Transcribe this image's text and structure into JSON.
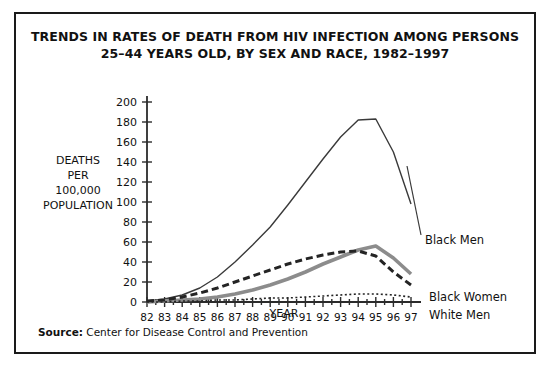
{
  "title": {
    "line1": "TRENDS IN RATES OF DEATH FROM HIV INFECTION AMONG PERSONS",
    "line2": "25–44 YEARS OLD, BY SEX AND RACE, 1982–1997"
  },
  "source": {
    "label": "Source:",
    "text": "Center for Disease Control and Prevention"
  },
  "axis_title": {
    "y_line1": "DEATHS",
    "y_line2": "PER",
    "y_line3": "100,000",
    "y_line4": "POPULATION",
    "x": "YEAR"
  },
  "chart_data": {
    "type": "line",
    "title": "TRENDS IN RATES OF DEATH FROM HIV INFECTION AMONG PERSONS 25–44 YEARS OLD, BY SEX AND RACE, 1982–1997",
    "xlabel": "YEAR",
    "ylabel": "DEATHS PER 100,000 POPULATION",
    "xlim": [
      82,
      97
    ],
    "ylim": [
      0,
      200
    ],
    "ytick_step": 20,
    "grid": false,
    "legend_position": "right-inline-labels",
    "categories": [
      "82",
      "83",
      "84",
      "85",
      "86",
      "87",
      "88",
      "89",
      "90",
      "91",
      "92",
      "93",
      "94",
      "95",
      "96",
      "97"
    ],
    "ytick_labels": [
      "0",
      "20",
      "40",
      "60",
      "80",
      "100",
      "120",
      "140",
      "160",
      "180",
      "200"
    ],
    "series": [
      {
        "name": "Black Men",
        "style": "thin-solid",
        "color": "#3a3a3a",
        "values": [
          1,
          3,
          7,
          14,
          25,
          40,
          57,
          75,
          97,
          120,
          143,
          165,
          182,
          183,
          150,
          98
        ]
      },
      {
        "name": "Black Women",
        "style": "thick-solid",
        "color": "#8c8c8c",
        "values": [
          0,
          1,
          2,
          3,
          5,
          8,
          12,
          17,
          23,
          30,
          38,
          45,
          52,
          56,
          44,
          28
        ]
      },
      {
        "name": "White Men",
        "style": "dashed",
        "color": "#242424",
        "values": [
          1,
          2,
          5,
          9,
          14,
          20,
          26,
          32,
          38,
          43,
          47,
          50,
          51,
          46,
          30,
          17
        ]
      },
      {
        "name": "White Women",
        "style": "dotted",
        "color": "#242424",
        "values": [
          0,
          0,
          1,
          1,
          2,
          2,
          3,
          4,
          4,
          5,
          6,
          7,
          8,
          8,
          7,
          5
        ]
      }
    ]
  }
}
